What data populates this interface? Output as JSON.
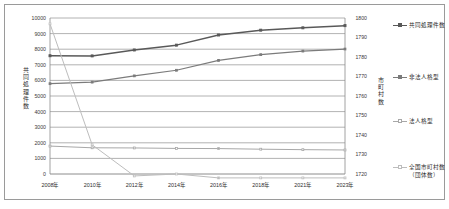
{
  "chart_data": {
    "type": "line",
    "title": "",
    "xlabel": "",
    "categories": [
      "2008年",
      "2010年",
      "2012年",
      "2014年",
      "2016年",
      "2018年",
      "2021年",
      "2023年"
    ],
    "left_axis": {
      "label": "共同処理件数",
      "ylim": [
        0,
        10000
      ],
      "ticks": [
        0,
        1000,
        2000,
        3000,
        4000,
        5000,
        6000,
        7000,
        8000,
        9000,
        10000
      ],
      "tick_labels": [
        "0",
        "1000",
        "2000",
        "3000",
        "4000",
        "5000",
        "6000",
        "7000",
        "8000",
        "9000",
        "10000"
      ]
    },
    "right_axis": {
      "label": "市町村数",
      "ylim": [
        1720,
        1800
      ],
      "ticks": [
        1720,
        1730,
        1740,
        1750,
        1760,
        1770,
        1780,
        1790,
        1800
      ],
      "tick_labels": [
        "1720",
        "1730",
        "1740",
        "1750",
        "1760",
        "1770",
        "1780",
        "1790",
        "1800"
      ]
    },
    "grid": true,
    "legend_position": "right",
    "series": [
      {
        "name": "共同処理件数",
        "axis": "left",
        "color": "#595959",
        "values": [
          7580,
          7570,
          7950,
          8260,
          8910,
          9220,
          9370,
          9510
        ]
      },
      {
        "name": "非法人格型",
        "axis": "left",
        "color": "#7b7b7b",
        "values": [
          5790,
          5890,
          6290,
          6650,
          7280,
          7650,
          7880,
          8010
        ]
      },
      {
        "name": "法人格型",
        "axis": "left",
        "color": "#a8a8a8",
        "values": [
          1790,
          1680,
          1670,
          1640,
          1630,
          1590,
          1560,
          1540
        ]
      },
      {
        "name": "全国市町村数（団体数）",
        "axis": "right",
        "color": "#bdbdbd",
        "values": [
          1797,
          1735,
          1719,
          1720,
          1718,
          1718,
          1718,
          1718
        ]
      }
    ]
  },
  "legend": {
    "items": [
      {
        "label": "共同処理件数",
        "color": "#595959"
      },
      {
        "label": "非法人格型",
        "color": "#7b7b7b"
      },
      {
        "label": "法人格型",
        "color": "#a8a8a8"
      },
      {
        "label": "全国市町村数（団体数）",
        "color": "#bdbdbd"
      }
    ]
  }
}
